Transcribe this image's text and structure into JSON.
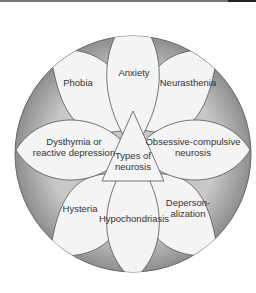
{
  "diagram": {
    "center": {
      "line1": "Types of",
      "line2": "neurosis"
    },
    "petals": [
      {
        "id": "anxiety",
        "lines": [
          "Anxiety"
        ]
      },
      {
        "id": "neurasthenia",
        "lines": [
          "Neurasthenia"
        ]
      },
      {
        "id": "obsessive-compulsive",
        "lines": [
          "Obsessive-compulsive",
          "neurosis"
        ]
      },
      {
        "id": "depersonalization",
        "lines": [
          "Deperson-",
          "alization"
        ]
      },
      {
        "id": "hypochondriasis",
        "lines": [
          "Hypochondriasis"
        ]
      },
      {
        "id": "hysteria",
        "lines": [
          "Hysteria"
        ]
      },
      {
        "id": "dysthymia",
        "lines": [
          "Dysthymia or",
          "reactive depression"
        ]
      },
      {
        "id": "phobia",
        "lines": [
          "Phobia"
        ]
      }
    ],
    "colors": {
      "ring": "#a9a9a9",
      "petal": "#f4f4f4",
      "stroke": "#555555"
    }
  }
}
